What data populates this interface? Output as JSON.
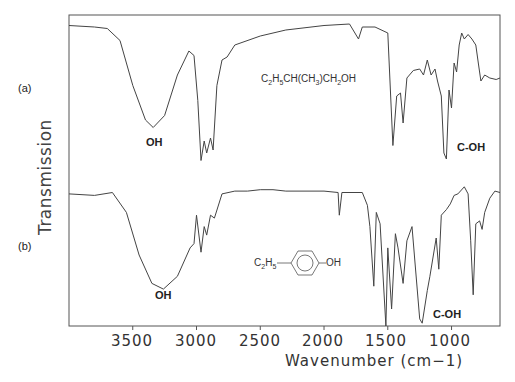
{
  "chart_data": {
    "type": "line",
    "title": "",
    "xlabel": "Wavenumber (cm−1)",
    "ylabel": "Transmission",
    "xlim": [
      4000,
      620
    ],
    "x_reversed": true,
    "xticks": [
      3500,
      3000,
      2500,
      2000,
      1500,
      1000
    ],
    "grid": false,
    "legend": "none",
    "series": [
      {
        "name": "(a)",
        "compound": "C2H5CH(CH3)CH2OH",
        "annotations": [
          {
            "text": "OH",
            "x": 3350
          },
          {
            "text": "C-OH",
            "x": 1040
          }
        ],
        "points": [
          [
            4000,
            0.95
          ],
          [
            3800,
            0.94
          ],
          [
            3700,
            0.93
          ],
          [
            3600,
            0.85
          ],
          [
            3500,
            0.55
          ],
          [
            3400,
            0.32
          ],
          [
            3340,
            0.27
          ],
          [
            3250,
            0.35
          ],
          [
            3150,
            0.62
          ],
          [
            3060,
            0.78
          ],
          [
            3020,
            0.75
          ],
          [
            2990,
            0.45
          ],
          [
            2965,
            0.05
          ],
          [
            2940,
            0.18
          ],
          [
            2920,
            0.1
          ],
          [
            2890,
            0.2
          ],
          [
            2870,
            0.12
          ],
          [
            2840,
            0.55
          ],
          [
            2800,
            0.72
          ],
          [
            2760,
            0.74
          ],
          [
            2700,
            0.82
          ],
          [
            2500,
            0.88
          ],
          [
            2300,
            0.92
          ],
          [
            2000,
            0.95
          ],
          [
            1800,
            0.96
          ],
          [
            1730,
            0.86
          ],
          [
            1700,
            0.94
          ],
          [
            1600,
            0.94
          ],
          [
            1500,
            0.9
          ],
          [
            1460,
            0.15
          ],
          [
            1430,
            0.48
          ],
          [
            1400,
            0.5
          ],
          [
            1380,
            0.3
          ],
          [
            1350,
            0.6
          ],
          [
            1300,
            0.65
          ],
          [
            1250,
            0.66
          ],
          [
            1220,
            0.62
          ],
          [
            1190,
            0.72
          ],
          [
            1160,
            0.62
          ],
          [
            1130,
            0.66
          ],
          [
            1110,
            0.58
          ],
          [
            1080,
            0.48
          ],
          [
            1060,
            0.1
          ],
          [
            1040,
            0.06
          ],
          [
            1020,
            0.52
          ],
          [
            1000,
            0.4
          ],
          [
            980,
            0.7
          ],
          [
            960,
            0.64
          ],
          [
            940,
            0.82
          ],
          [
            920,
            0.9
          ],
          [
            900,
            0.86
          ],
          [
            870,
            0.89
          ],
          [
            840,
            0.86
          ],
          [
            810,
            0.82
          ],
          [
            790,
            0.7
          ],
          [
            770,
            0.58
          ],
          [
            740,
            0.62
          ],
          [
            700,
            0.6
          ],
          [
            650,
            0.59
          ],
          [
            620,
            0.6
          ]
        ]
      },
      {
        "name": "(b)",
        "compound": "4-ethylphenol (C2H5–C6H4–OH)",
        "annotations": [
          {
            "text": "OH",
            "x": 3260
          },
          {
            "text": "C-OH",
            "x": 1230
          }
        ],
        "points": [
          [
            4000,
            0.93
          ],
          [
            3800,
            0.92
          ],
          [
            3660,
            0.94
          ],
          [
            3550,
            0.8
          ],
          [
            3450,
            0.5
          ],
          [
            3350,
            0.3
          ],
          [
            3260,
            0.26
          ],
          [
            3150,
            0.35
          ],
          [
            3050,
            0.55
          ],
          [
            3020,
            0.58
          ],
          [
            3000,
            0.78
          ],
          [
            2965,
            0.52
          ],
          [
            2940,
            0.7
          ],
          [
            2920,
            0.64
          ],
          [
            2890,
            0.78
          ],
          [
            2860,
            0.76
          ],
          [
            2800,
            0.93
          ],
          [
            2700,
            0.95
          ],
          [
            2600,
            0.95
          ],
          [
            2500,
            0.96
          ],
          [
            2400,
            0.96
          ],
          [
            2300,
            0.95
          ],
          [
            2000,
            0.95
          ],
          [
            1890,
            0.94
          ],
          [
            1880,
            0.78
          ],
          [
            1860,
            0.94
          ],
          [
            1700,
            0.94
          ],
          [
            1660,
            0.85
          ],
          [
            1640,
            0.7
          ],
          [
            1610,
            0.28
          ],
          [
            1590,
            0.8
          ],
          [
            1560,
            0.72
          ],
          [
            1515,
            0.0
          ],
          [
            1500,
            0.55
          ],
          [
            1470,
            0.12
          ],
          [
            1440,
            0.65
          ],
          [
            1420,
            0.55
          ],
          [
            1380,
            0.3
          ],
          [
            1350,
            0.6
          ],
          [
            1310,
            0.7
          ],
          [
            1250,
            0.05
          ],
          [
            1230,
            0.02
          ],
          [
            1190,
            0.25
          ],
          [
            1170,
            0.35
          ],
          [
            1120,
            0.62
          ],
          [
            1100,
            0.4
          ],
          [
            1080,
            0.78
          ],
          [
            1040,
            0.82
          ],
          [
            1010,
            0.86
          ],
          [
            980,
            0.92
          ],
          [
            950,
            0.93
          ],
          [
            900,
            0.98
          ],
          [
            870,
            0.93
          ],
          [
            850,
            0.6
          ],
          [
            830,
            0.22
          ],
          [
            810,
            0.72
          ],
          [
            780,
            0.74
          ],
          [
            760,
            0.68
          ],
          [
            740,
            0.8
          ],
          [
            700,
            0.9
          ],
          [
            660,
            0.95
          ],
          [
            620,
            0.94
          ]
        ]
      }
    ]
  },
  "labels": {
    "series_a": "(a)",
    "series_b": "(b)",
    "oh_a": "OH",
    "coh_a": "C-OH",
    "oh_b": "OH",
    "coh_b": "C-OH",
    "ylabel": "Transmission",
    "xlabel": "Wavenumber (cm−1)",
    "formula_b_left": "C2H5",
    "formula_b_right": "OH",
    "ticks": [
      "3500",
      "3000",
      "2500",
      "2000",
      "1500",
      "1000"
    ]
  }
}
